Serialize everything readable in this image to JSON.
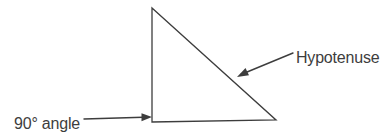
{
  "colors": {
    "background": "#ffffff",
    "ink": "#3d3d3d"
  },
  "triangle": {
    "points": "152,8 152,122 276,120"
  },
  "labels": {
    "hypotenuse": "Hypotenuse",
    "right_angle": "90° angle"
  },
  "arrows": {
    "hypotenuse": {
      "line": "293,53 241,74.5",
      "head": "237,77 245.5,68 249,75.2"
    },
    "right_angle": {
      "line": "84,119 143,117.3",
      "head": "152,117 141.5,113.2 141.5,121.2"
    }
  }
}
